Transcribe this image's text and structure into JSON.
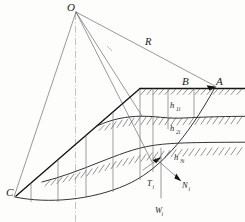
{
  "figure": {
    "type": "engineering-diagram",
    "background_color": "#fdfdfb",
    "line_color": "#1c1c1c",
    "canvas": {
      "width": 245,
      "height": 222
    }
  },
  "labels": {
    "center_point": "O",
    "radius": "R",
    "crest_point": "A",
    "slope_top_point": "B",
    "toe_point": "C",
    "layer1_height": "h",
    "layer1_height_sub": "1i",
    "layer2_height": "h",
    "layer2_height_sub": "2i",
    "layer3_height": "h",
    "layer3_height_sub": "3i",
    "tangential_force": "T",
    "tangential_force_sub": "i",
    "normal_force": "N",
    "normal_force_sub": "i",
    "weight_force": "W",
    "weight_force_sub": "i"
  },
  "elements": {
    "center_of_rotation": "O",
    "radius_line": "R",
    "vertical_centerline": "axis-of-rotation",
    "ground_surface": "hatched ground line through A and B",
    "stratum_boundary_1": "first soil layer interface",
    "stratum_boundary_2": "second soil layer interface",
    "slip_surface": "circular arc from C to A",
    "slice_count": 6,
    "force_vectors": [
      "T",
      "N",
      "W"
    ]
  }
}
